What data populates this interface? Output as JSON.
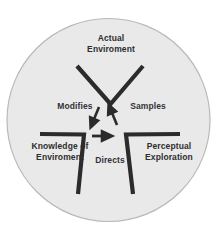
{
  "diagram": {
    "shape": "circle",
    "background_color": "#ffffff",
    "circle_fill_color": "#e9e9e9",
    "circle_stroke_color": "#b4b4b4",
    "stroke_color": "#2b2b2b",
    "text_color": "#2e2e2e",
    "nodes": [
      {
        "id": "actual-environment",
        "label": "Actual\nEnviroment",
        "position": "top"
      },
      {
        "id": "knowledge-of-environment",
        "label": "Knowledge of\nEnviroment",
        "position": "bottom-left"
      },
      {
        "id": "perceptual-exploration",
        "label": "Perceptual\nExploration",
        "position": "bottom-right"
      }
    ],
    "edges": [
      {
        "id": "modifies",
        "label": "Modifies",
        "from": "actual-environment",
        "to": "knowledge-of-environment",
        "arrow_direction": "down-left"
      },
      {
        "id": "samples",
        "label": "Samples",
        "from": "perceptual-exploration",
        "to": "actual-environment",
        "arrow_direction": "up-right"
      },
      {
        "id": "directs",
        "label": "Directs",
        "from": "knowledge-of-environment",
        "to": "perceptual-exploration",
        "arrow_direction": "right"
      }
    ]
  }
}
